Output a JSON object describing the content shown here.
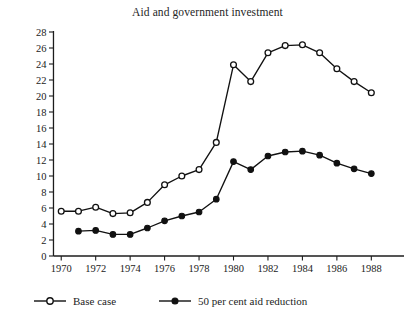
{
  "chart_data": {
    "type": "line",
    "title": "Aid and government investment",
    "xlabel": "",
    "ylabel": "",
    "x": [
      1970,
      1971,
      1972,
      1973,
      1974,
      1975,
      1976,
      1977,
      1978,
      1979,
      1980,
      1981,
      1982,
      1983,
      1984,
      1985,
      1986,
      1987,
      1988
    ],
    "xlim": [
      1969,
      1989.2
    ],
    "ylim": [
      0,
      28
    ],
    "grid": false,
    "legend_position": "bottom-left",
    "x_tick_labels": [
      "1970",
      "1972",
      "1974",
      "1976",
      "1978",
      "1980",
      "1982",
      "1984",
      "1986",
      "1988"
    ],
    "x_tick_values": [
      1970,
      1972,
      1974,
      1976,
      1978,
      1980,
      1982,
      1984,
      1986,
      1988
    ],
    "y_tick_labels": [
      "0",
      "2",
      "4",
      "6",
      "8",
      "10",
      "12",
      "14",
      "16",
      "18",
      "20",
      "22",
      "24",
      "26",
      "28"
    ],
    "y_tick_values": [
      0,
      2,
      4,
      6,
      8,
      10,
      12,
      14,
      16,
      18,
      20,
      22,
      24,
      26,
      28
    ],
    "series": [
      {
        "name": "Base case",
        "marker": "open-circle",
        "x": [
          1970,
          1971,
          1972,
          1973,
          1974,
          1975,
          1976,
          1977,
          1978,
          1979,
          1980,
          1981,
          1982,
          1983,
          1984,
          1985,
          1986,
          1987,
          1988
        ],
        "values": [
          5.6,
          5.6,
          6.1,
          5.3,
          5.4,
          6.7,
          8.9,
          10.0,
          10.8,
          14.2,
          23.9,
          21.8,
          25.4,
          26.3,
          26.4,
          25.4,
          23.4,
          21.8,
          20.4
        ]
      },
      {
        "name": "50 per cent aid reduction",
        "marker": "filled-circle",
        "x": [
          1971,
          1972,
          1973,
          1974,
          1975,
          1976,
          1977,
          1978,
          1979,
          1980,
          1981,
          1982,
          1983,
          1984,
          1985,
          1986,
          1987,
          1988
        ],
        "values": [
          3.1,
          3.2,
          2.7,
          2.7,
          3.5,
          4.4,
          5.0,
          5.5,
          7.1,
          11.8,
          10.8,
          12.5,
          13.0,
          13.1,
          12.6,
          11.6,
          10.9,
          10.3
        ]
      }
    ]
  },
  "legend": {
    "entries": [
      {
        "label": "Base case",
        "marker": "open-circle"
      },
      {
        "label": "50 per cent aid reduction",
        "marker": "filled-circle"
      }
    ]
  },
  "colors": {
    "line": "#111111",
    "marker_fill_open": "#ffffff",
    "marker_fill_closed": "#111111",
    "axis": "#1c1c1c",
    "text": "#1d1d1d",
    "background": "#ffffff"
  }
}
